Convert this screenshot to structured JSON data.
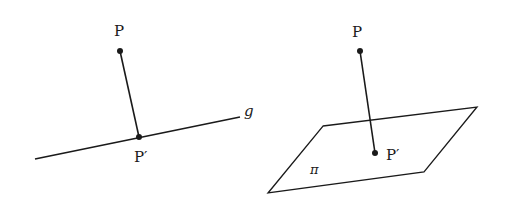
{
  "colors": {
    "stroke": "#1a1a1a",
    "background": "#ffffff"
  },
  "figure_left": {
    "description": "Orthogonal projection of point P onto line g",
    "point_label": "P",
    "foot_label": "P′",
    "line_label": "g",
    "point": [
      120,
      51
    ],
    "foot": [
      139,
      137
    ],
    "line_start": [
      35,
      159
    ],
    "line_end": [
      240,
      117
    ]
  },
  "figure_right": {
    "description": "Orthogonal projection of point P onto plane π",
    "point_label": "P",
    "foot_label": "P′",
    "plane_label": "π",
    "point": [
      360,
      51
    ],
    "foot": [
      375,
      153
    ],
    "plane_corners": [
      [
        323,
        126
      ],
      [
        477,
        107
      ],
      [
        424,
        172
      ],
      [
        268,
        193
      ]
    ]
  }
}
